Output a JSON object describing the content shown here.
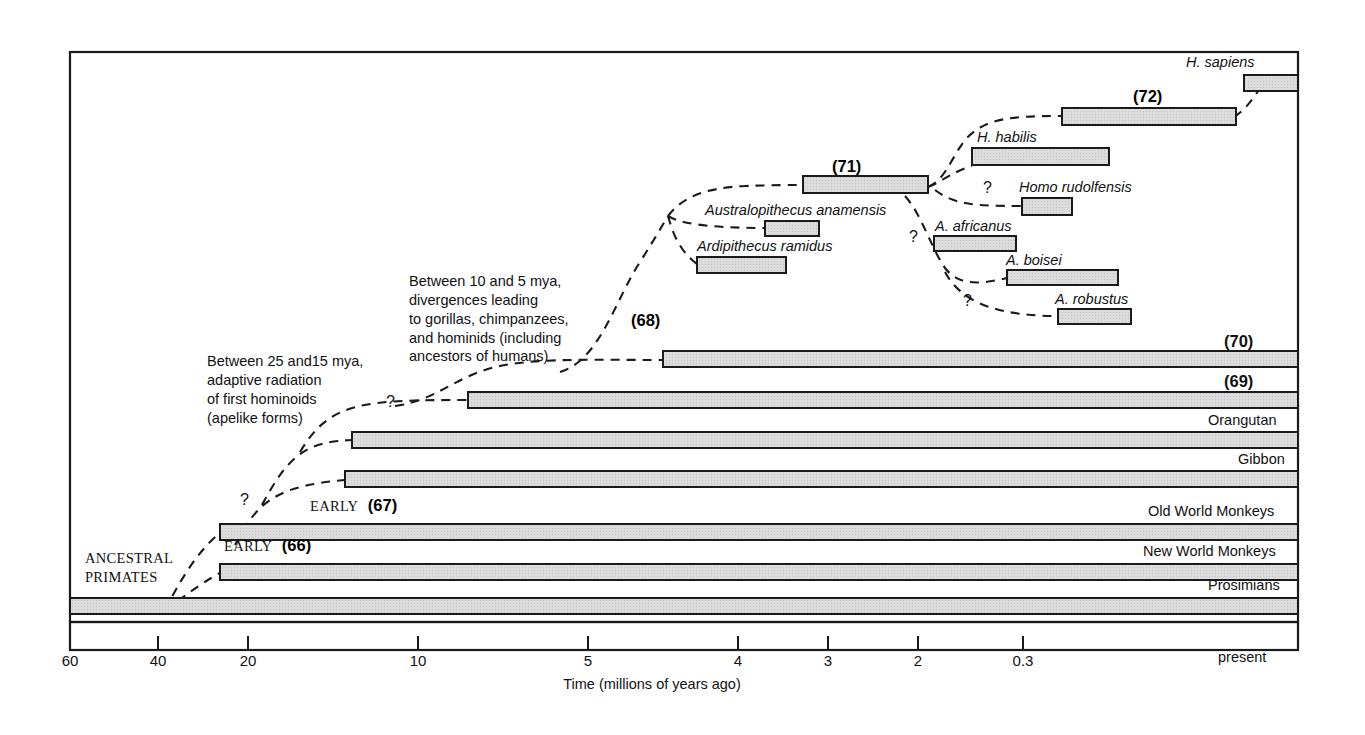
{
  "figure": {
    "axis_title": "Time (millions of years ago)",
    "present_label": "present",
    "ticks": [
      {
        "label": "60",
        "x": 70
      },
      {
        "label": "40",
        "x": 158
      },
      {
        "label": "20",
        "x": 248
      },
      {
        "label": "10",
        "x": 418
      },
      {
        "label": "5",
        "x": 588
      },
      {
        "label": "4",
        "x": 738
      },
      {
        "label": "3",
        "x": 828
      },
      {
        "label": "2",
        "x": 918
      },
      {
        "label": "0.3",
        "x": 1023
      }
    ]
  },
  "annotations": {
    "note_hominoids": "Between 25 and15 mya,\nadaptive radiation\nof first hominoids\n(apelike forms)",
    "note_divergence": "Between 10 and 5 mya,\ndivergences leading\nto gorillas, chimpanzees,\nand hominids (including\nancestors of humans)",
    "ancestral_primates": "ANCESTRAL\nPRIMATES",
    "early_67_word": "EARLY",
    "early_67_num": "(67)",
    "early_66_word": "EARLY",
    "early_66_num": "(66)",
    "q1": "?",
    "q2": "?",
    "q3": "?",
    "q4": "?",
    "q5": "?"
  },
  "taxa": {
    "h_sapiens": "H. sapiens",
    "n72": "(72)",
    "h_habilis": "H. habilis",
    "h_rudolfensis": "Homo rudolfensis",
    "n71": "(71)",
    "a_anamensis": "Australopithecus anamensis",
    "ardipithecus": "Ardipithecus ramidus",
    "a_africanus": "A. africanus",
    "a_boisei": "A. boisei",
    "a_robustus": "A. robustus",
    "n68": "(68)",
    "n70": "(70)",
    "n69": "(69)",
    "orangutan": "Orangutan",
    "gibbon": "Gibbon",
    "old_world_monkeys": "Old World Monkeys",
    "new_world_monkeys": "New World Monkeys",
    "prosimians": "Prosimians"
  },
  "chart_data": {
    "type": "bar",
    "xlabel": "Time (millions of years ago)",
    "ylabel": "",
    "axis_direction": "reversed",
    "xlim": [
      60,
      0
    ],
    "grid": false,
    "legend": "none",
    "note": "Horizontal bars denote the temporal range of each lineage; dashed lines denote inferred branch points.",
    "bars": [
      {
        "name": "H. sapiens",
        "start_mya": 0.3,
        "end_mya": 0.0,
        "row": 1
      },
      {
        "name": "(72)",
        "start_mya": 1.9,
        "end_mya": 0.4,
        "row": 2
      },
      {
        "name": "H. habilis",
        "start_mya": 2.4,
        "end_mya": 1.6,
        "row": 3
      },
      {
        "name": "(71)",
        "start_mya": 4.2,
        "end_mya": 3.0,
        "row": 4
      },
      {
        "name": "Homo rudolfensis",
        "start_mya": 2.3,
        "end_mya": 1.8,
        "row": 5
      },
      {
        "name": "Australopithecus anamensis",
        "start_mya": 4.5,
        "end_mya": 3.9,
        "row": 6
      },
      {
        "name": "A. africanus",
        "start_mya": 3.1,
        "end_mya": 2.2,
        "row": 7
      },
      {
        "name": "Ardipithecus ramidus",
        "start_mya": 5.2,
        "end_mya": 4.2,
        "row": 8
      },
      {
        "name": "A. boisei",
        "start_mya": 2.3,
        "end_mya": 1.1,
        "row": 9
      },
      {
        "name": "A. robustus",
        "start_mya": 1.8,
        "end_mya": 1.0,
        "row": 10
      },
      {
        "name": "(70)",
        "start_mya": 8.0,
        "end_mya": 0.0,
        "row": 11
      },
      {
        "name": "(69)",
        "start_mya": 11.0,
        "end_mya": 0.0,
        "row": 12
      },
      {
        "name": "Orangutan",
        "start_mya": 13.5,
        "end_mya": 0.0,
        "row": 13
      },
      {
        "name": "Gibbon",
        "start_mya": 14.0,
        "end_mya": 0.0,
        "row": 14
      },
      {
        "name": "Old World Monkeys",
        "start_mya": 24.0,
        "end_mya": 0.0,
        "row": 15
      },
      {
        "name": "New World Monkeys",
        "start_mya": 24.0,
        "end_mya": 0.0,
        "row": 16
      },
      {
        "name": "Prosimians",
        "start_mya": 60.0,
        "end_mya": 0.0,
        "row": 17
      }
    ]
  },
  "colors": {
    "bar_fill": "#d8d8d8",
    "bar_stroke": "#1a1a1a",
    "frame": "#1a1a1a",
    "text": "#111111"
  }
}
